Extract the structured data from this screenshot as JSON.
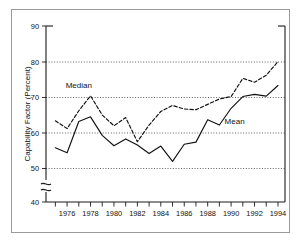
{
  "chart_data": {
    "type": "line",
    "title": "",
    "xlabel": "",
    "ylabel": "Capability Factor (Percent)",
    "xlim": [
      1974.2,
      1994.6
    ],
    "ylim": [
      40,
      90
    ],
    "y_axis_break": {
      "from": 40,
      "to": 50,
      "note": "axis break drawn between 40 and 50"
    },
    "grid": "horizontal dotted gridlines at 50, 60, 70, 80",
    "legend_position": "inline annotations on curves",
    "yticks": [
      40,
      50,
      60,
      70,
      80,
      90
    ],
    "yticklabels": [
      "40",
      "50",
      "60",
      "70",
      "80",
      "90"
    ],
    "xticks": [
      1975,
      1976,
      1977,
      1978,
      1979,
      1980,
      1981,
      1982,
      1983,
      1984,
      1985,
      1986,
      1987,
      1988,
      1989,
      1990,
      1991,
      1992,
      1993,
      1994
    ],
    "xticklabels_shown": [
      "1976",
      "1978",
      "1980",
      "1982",
      "1984",
      "1986",
      "1988",
      "1990",
      "1992",
      "1994"
    ],
    "x": [
      1975,
      1976,
      1977,
      1978,
      1979,
      1980,
      1981,
      1982,
      1983,
      1984,
      1985,
      1986,
      1987,
      1988,
      1989,
      1990,
      1991,
      1992,
      1993,
      1994
    ],
    "series": [
      {
        "name": "Median",
        "style": "dashed",
        "annotation": "Median",
        "values": [
          63.4,
          61.2,
          66.2,
          70.4,
          65.0,
          62.0,
          64.3,
          57.5,
          62.2,
          66.0,
          67.7,
          66.7,
          66.5,
          68.0,
          69.5,
          70.2,
          75.3,
          74.2,
          76.2,
          80.0
        ]
      },
      {
        "name": "Mean",
        "style": "solid",
        "annotation": "Mean",
        "values": [
          55.8,
          54.4,
          63.2,
          64.5,
          59.3,
          56.4,
          58.3,
          56.6,
          54.2,
          56.3,
          52.0,
          56.8,
          57.4,
          63.7,
          62.2,
          66.9,
          70.2,
          70.8,
          70.3,
          73.3
        ]
      }
    ],
    "annotations": [
      {
        "text": "Median",
        "x": 1977.0,
        "y": 72.6
      },
      {
        "text": "Mean",
        "x": 1990.3,
        "y": 62.6
      }
    ]
  },
  "axis": {
    "ylabel": "Capability Factor (Percent)",
    "ytick_90": "90",
    "ytick_80": "80",
    "ytick_70": "70",
    "ytick_60": "60",
    "ytick_50": "50",
    "ytick_40": "40"
  },
  "annotations": {
    "median_label": "Median",
    "mean_label": "Mean"
  },
  "colors": {
    "background": "#ffffff",
    "frame": "#9a9a9a",
    "axis": "#1a1a1a",
    "grid": "#3a3a3a",
    "series": "#111111"
  }
}
